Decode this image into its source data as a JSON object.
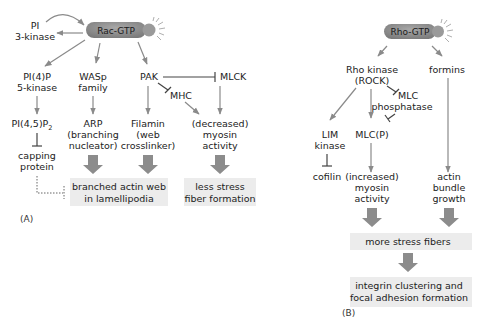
{
  "panel_a": {
    "label": "(A)",
    "hub": "Rac-GTP",
    "nodes": {
      "pi3k_1": "PI",
      "pi3k_2": "3-kinase",
      "pi4p_1": "PI(4)P",
      "pi4p_2": "5-kinase",
      "wasp_1": "WASp",
      "wasp_2": "family",
      "pak": "PAK",
      "mlck": "MLCK",
      "mhc": "MHC",
      "pip2": "PI(4,5)P",
      "pip2_sub": "2",
      "arp_1": "ARP",
      "arp_2": "(branching",
      "arp_3": "nucleator)",
      "filamin_1": "Filamin",
      "filamin_2": "(web",
      "filamin_3": "crosslinker)",
      "dec_1": "(decreased)",
      "dec_2": "myosin",
      "dec_3": "activity",
      "cap_1": "capping",
      "cap_2": "protein"
    },
    "outcomes": {
      "branched_1": "branched actin web",
      "branched_2": "in lamellipodia",
      "less_1": "less stress",
      "less_2": "fiber formation"
    }
  },
  "panel_b": {
    "label": "(B)",
    "hub": "Rho-GTP",
    "nodes": {
      "rock_1": "Rho kinase",
      "rock_2": "(ROCK)",
      "formins": "formins",
      "mlcp_1": "MLC",
      "mlcp_2": "phosphatase",
      "lim_1": "LIM",
      "lim_2": "kinase",
      "mlcp": "MLC(P)",
      "cofilin": "cofilin",
      "inc_1": "(increased)",
      "inc_2": "myosin",
      "inc_3": "activity",
      "bundle_1": "actin",
      "bundle_2": "bundle",
      "bundle_3": "growth"
    },
    "outcomes": {
      "more": "more stress fibers",
      "integrin_1": "integrin clustering and",
      "integrin_2": "focal adhesion formation"
    }
  },
  "colors": {
    "pill": "#8e8e8e",
    "arrow": "#8a8a8a",
    "block_arrow": "#8c8c8c",
    "box": "#ececec",
    "text": "#222222"
  }
}
